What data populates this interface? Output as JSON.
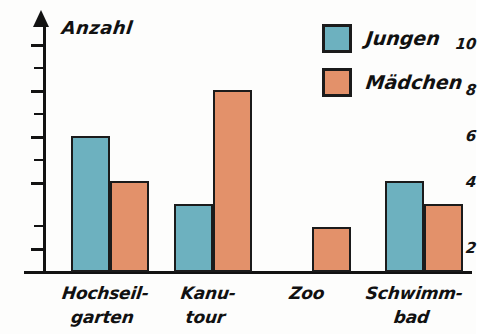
{
  "chart_data": {
    "type": "bar",
    "title": "",
    "ylabel": "Anzahl",
    "xlabel": "",
    "categories": [
      "Hochseil-garten",
      "Kanu-tour",
      "Zoo",
      "Schwimm-bad"
    ],
    "category_lines": [
      [
        "Hochseil-",
        "garten"
      ],
      [
        "Kanu-",
        "tour"
      ],
      [
        "Zoo",
        ""
      ],
      [
        "Schwimm-",
        "bad"
      ]
    ],
    "series": [
      {
        "name": "Jungen",
        "color": "#6db1bf",
        "values": [
          6,
          3,
          0,
          4
        ]
      },
      {
        "name": "Mädchen",
        "color": "#e3916a",
        "values": [
          4,
          8,
          2,
          3
        ]
      }
    ],
    "ylim": [
      0,
      11
    ],
    "y_major_ticks": [
      2,
      4,
      6,
      8,
      10
    ],
    "y_major_tick_labels": [
      "2",
      "4",
      "6",
      "8",
      "10"
    ],
    "y_minor_ticks": [
      1,
      3,
      5,
      7,
      9
    ],
    "grid": false,
    "legend_position": "top-right",
    "axis_arrow": true,
    "bar_outline_color": "#1b1b1b"
  },
  "axis": {
    "y_title": "Anzahl",
    "tick_2": "2",
    "tick_4": "4",
    "tick_6": "6",
    "tick_8": "8",
    "tick_10": "10"
  },
  "legend": {
    "items": [
      {
        "label": "Jungen",
        "color": "#6db1bf"
      },
      {
        "label": "Mädchen",
        "color": "#e3916a"
      }
    ]
  },
  "categories": [
    {
      "line1": "Hochseil-",
      "line2": "garten"
    },
    {
      "line1": "Kanu-",
      "line2": "tour"
    },
    {
      "line1": "Zoo",
      "line2": ""
    },
    {
      "line1": "Schwimm-",
      "line2": "bad"
    }
  ]
}
